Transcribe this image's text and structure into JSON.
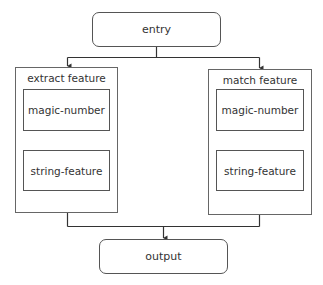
{
  "diagram": {
    "entry": {
      "label": "entry"
    },
    "output": {
      "label": "output"
    },
    "groups": [
      {
        "label": "extract feature",
        "items": [
          {
            "label": "magic-number"
          },
          {
            "label": "string-feature"
          }
        ]
      },
      {
        "label": "match feature",
        "items": [
          {
            "label": "magic-number"
          },
          {
            "label": "string-feature"
          }
        ]
      }
    ],
    "edges": [
      {
        "from": "entry",
        "to": "extract feature"
      },
      {
        "from": "entry",
        "to": "match feature"
      },
      {
        "from": "extract feature",
        "to": "output"
      },
      {
        "from": "match feature",
        "to": "output"
      }
    ],
    "colors": {
      "stroke": "#555555",
      "text": "#333333",
      "background": "#ffffff"
    }
  }
}
